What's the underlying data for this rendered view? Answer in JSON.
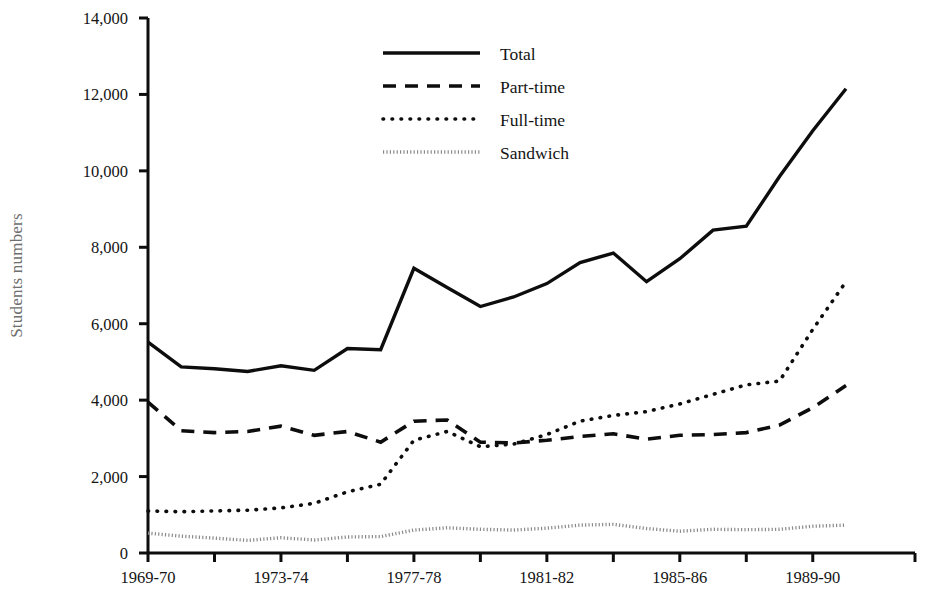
{
  "chart_data": {
    "type": "line",
    "title": "",
    "xlabel": "",
    "ylabel": "Students numbers",
    "ylim": [
      0,
      14000
    ],
    "ytick_values": [
      0,
      2000,
      4000,
      6000,
      8000,
      10000,
      12000,
      14000
    ],
    "ytick_labels": [
      "0",
      "2,000",
      "4,000",
      "6,000",
      "8,000",
      "10,000",
      "12,000",
      "14,000"
    ],
    "grid": false,
    "legend_position": "top-center",
    "x": [
      "1969-70",
      "1970-71",
      "1971-72",
      "1972-73",
      "1973-74",
      "1974-75",
      "1975-76",
      "1976-77",
      "1977-78",
      "1978-79",
      "1979-80",
      "1980-81",
      "1981-82",
      "1982-83",
      "1983-84",
      "1984-85",
      "1985-86",
      "1986-87",
      "1987-88",
      "1988-89",
      "1989-90",
      "1990-91"
    ],
    "xtick_labels": [
      "1969-70",
      "1973-74",
      "1977-78",
      "1981-82",
      "1985-86",
      "1989-90"
    ],
    "xtick_indices": [
      0,
      4,
      8,
      12,
      16,
      20
    ],
    "series": [
      {
        "name": "Total",
        "style": "solid",
        "color": "#0d0d0d",
        "values": [
          5520,
          4870,
          4820,
          4750,
          4900,
          4780,
          5350,
          5320,
          7450,
          6950,
          6450,
          6700,
          7050,
          7600,
          7850,
          7100,
          7700,
          8450,
          8550,
          9850,
          11050,
          12150
        ]
      },
      {
        "name": "Part-time",
        "style": "dashed",
        "color": "#0d0d0d",
        "values": [
          3950,
          3200,
          3150,
          3180,
          3320,
          3080,
          3180,
          2900,
          3450,
          3480,
          2900,
          2880,
          2950,
          3050,
          3120,
          2980,
          3080,
          3100,
          3150,
          3350,
          3800,
          4380
        ]
      },
      {
        "name": "Full-time",
        "style": "dotted",
        "color": "#0d0d0d",
        "values": [
          1100,
          1080,
          1100,
          1120,
          1180,
          1300,
          1600,
          1800,
          2950,
          3180,
          2780,
          2850,
          3100,
          3450,
          3600,
          3700,
          3900,
          4150,
          4400,
          4500,
          5850,
          7100
        ]
      },
      {
        "name": "Sandwich",
        "style": "gray-dotted",
        "color": "#8a8a8a",
        "values": [
          520,
          440,
          390,
          330,
          400,
          340,
          420,
          430,
          600,
          660,
          620,
          600,
          650,
          730,
          750,
          640,
          570,
          620,
          610,
          620,
          700,
          730
        ]
      }
    ]
  },
  "legend": {
    "items": [
      {
        "label": "Total",
        "style": "solid"
      },
      {
        "label": "Part-time",
        "style": "dashed"
      },
      {
        "label": "Full-time",
        "style": "dotted"
      },
      {
        "label": "Sandwich",
        "style": "gray-dotted"
      }
    ]
  }
}
